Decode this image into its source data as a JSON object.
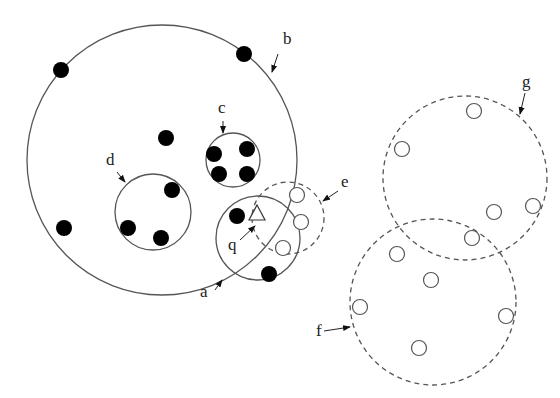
{
  "diagram": {
    "colors": {
      "stroke": "#555555",
      "dot": "#000000",
      "bg": "#ffffff"
    },
    "regions": [
      {
        "id": "b",
        "label": "b",
        "cx": 162,
        "cy": 160,
        "r": 135,
        "style": "solid"
      },
      {
        "id": "c",
        "label": "c",
        "cx": 233,
        "cy": 160,
        "r": 27,
        "style": "solid"
      },
      {
        "id": "d",
        "label": "d",
        "cx": 153,
        "cy": 212,
        "r": 38,
        "style": "solid"
      },
      {
        "id": "a",
        "label": "a",
        "cx": 258,
        "cy": 238,
        "r": 42,
        "style": "solid"
      },
      {
        "id": "e",
        "label": "e",
        "cx": 288,
        "cy": 218,
        "r": 36,
        "style": "dashed"
      },
      {
        "id": "g",
        "label": "g",
        "cx": 465,
        "cy": 178,
        "r": 82,
        "style": "dashed"
      },
      {
        "id": "f",
        "label": "f",
        "cx": 433,
        "cy": 302,
        "r": 83,
        "style": "dashed"
      }
    ],
    "labels": [
      {
        "text": "b",
        "x": 283,
        "y": 44,
        "arrow": [
          278,
          54,
          272,
          72
        ]
      },
      {
        "text": "c",
        "x": 218,
        "y": 113,
        "arrow": [
          223,
          121,
          223,
          133
        ]
      },
      {
        "text": "d",
        "x": 106,
        "y": 165,
        "arrow": [
          117,
          172,
          125,
          182
        ]
      },
      {
        "text": "a",
        "x": 200,
        "y": 297,
        "arrow": [
          215,
          290,
          222,
          280
        ]
      },
      {
        "text": "e",
        "x": 341,
        "y": 187,
        "arrow": [
          338,
          191,
          323,
          201
        ]
      },
      {
        "text": "g",
        "x": 522,
        "y": 87,
        "arrow": [
          525,
          93,
          520,
          114
        ]
      },
      {
        "text": "f",
        "x": 316,
        "y": 336,
        "arrow": [
          324,
          331,
          350,
          327
        ]
      },
      {
        "text": "q",
        "x": 228,
        "y": 250,
        "arrow": [
          240,
          240,
          255,
          226
        ]
      }
    ],
    "filled_points": [
      [
        61,
        70
      ],
      [
        244,
        54
      ],
      [
        166,
        138
      ],
      [
        214,
        154
      ],
      [
        247,
        149
      ],
      [
        219,
        174
      ],
      [
        247,
        174
      ],
      [
        172,
        190
      ],
      [
        128,
        228
      ],
      [
        161,
        238
      ],
      [
        64,
        228
      ],
      [
        237,
        216
      ],
      [
        269,
        274
      ]
    ],
    "hollow_points": [
      [
        297,
        195
      ],
      [
        301,
        222
      ],
      [
        283,
        248
      ],
      [
        474,
        111
      ],
      [
        402,
        149
      ],
      [
        494,
        212
      ],
      [
        533,
        206
      ],
      [
        472,
        238
      ],
      [
        397,
        254
      ],
      [
        431,
        280
      ],
      [
        360,
        307
      ],
      [
        506,
        316
      ],
      [
        419,
        348
      ]
    ],
    "query": {
      "label": "q",
      "x": 257,
      "y": 214
    }
  }
}
